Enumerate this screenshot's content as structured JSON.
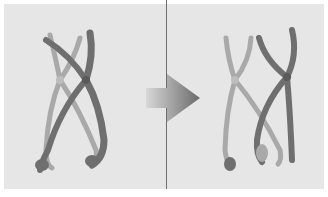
{
  "diagram": {
    "type": "before-after",
    "panels": [
      {
        "name": "before",
        "description": "homologous chromosomes paired, chiasma crossing"
      },
      {
        "name": "after",
        "description": "chromosomes with exchanged segments (recombinant)"
      }
    ],
    "arrow": {
      "direction": "right",
      "meaning": "transition"
    },
    "colors": {
      "background": "#e6e6e6",
      "border": "#ffffff",
      "light_chromosome": "#a9a9a9",
      "dark_chromosome": "#6f6f6f",
      "arrow_start": "#d8d8d8",
      "arrow_end": "#6a6a6a",
      "divider": "#6e6e6e"
    }
  }
}
